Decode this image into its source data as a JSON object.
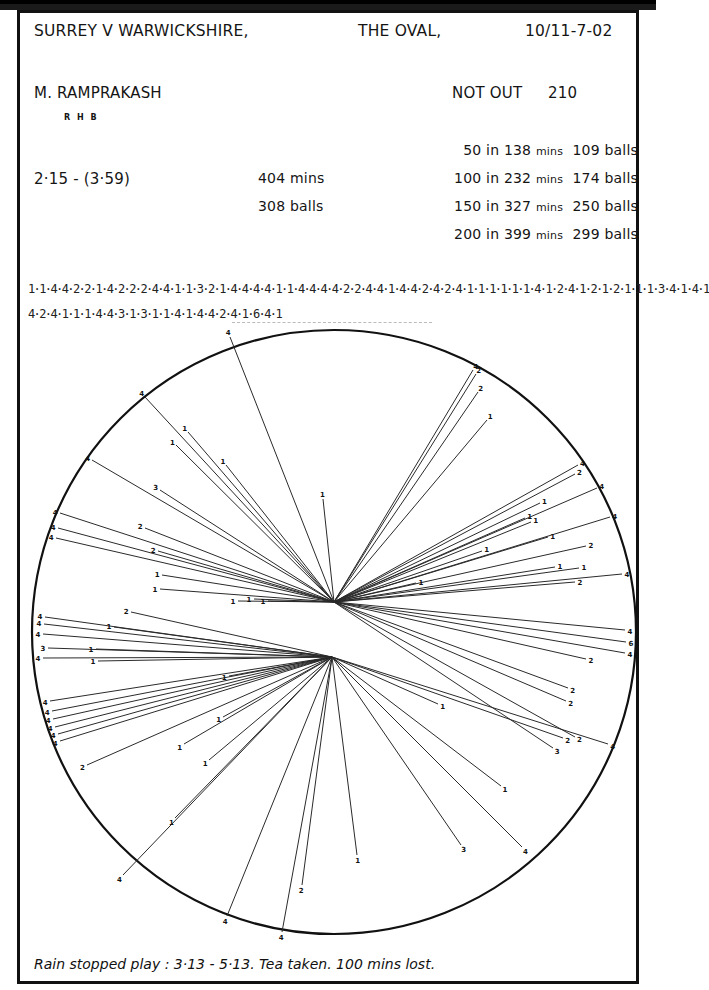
{
  "header": {
    "match": "SURREY V WARWICKSHIRE,",
    "venue": "THE OVAL,",
    "dates": "10/11-7-02"
  },
  "batsman": {
    "name": "M. RAMPRAKASH",
    "hand": "R H B",
    "status": "NOT OUT",
    "score": "210",
    "time_span": "2·15 - (3·59)",
    "minutes": "404 mins",
    "balls": "308 balls"
  },
  "milestones": [
    {
      "runs": "50 in",
      "mins": "138",
      "mins_unit": "mins",
      "balls": "109",
      "balls_unit": "balls"
    },
    {
      "runs": "100 in",
      "mins": "232",
      "mins_unit": "mins",
      "balls": "174",
      "balls_unit": "balls"
    },
    {
      "runs": "150 in",
      "mins": "327",
      "mins_unit": "mins",
      "balls": "250",
      "balls_unit": "balls"
    },
    {
      "runs": "200 in",
      "mins": "399",
      "mins_unit": "mins",
      "balls": "299",
      "balls_unit": "balls"
    }
  ],
  "scoring_sequence": {
    "line1": "1·1·4·4·2·2·1·4·2·2·2·4·4·1·1·3·2·1·4·4·4·4·1·1·4·4·4·4·2·2·4·4·1·4·4·2·4·2·4·1·1·1·1·1·1·4·1·2·4·1·2·1·2·1·1·1·3·4·1·4·1",
    "line2": "4·2·4·1·1·1·4·4·3·1·3·1·1·4·1·4·4·2·4·1·6·4·1"
  },
  "footer": {
    "note": "Rain stopped play : 3·13 - 5·13. Tea taken. 100 mins lost."
  },
  "colors": {
    "ink": "#111111",
    "line": "#2a2a2a",
    "paper": "#ffffff"
  },
  "chart_data": {
    "type": "wagon-wheel",
    "circle": {
      "cx": 334,
      "cy": 632,
      "r": 302
    },
    "origins": {
      "upper": [
        334,
        602
      ],
      "lower": [
        332,
        657
      ]
    },
    "shots": [
      {
        "o": "upper",
        "x": 230,
        "y": 337,
        "runs": "4"
      },
      {
        "o": "upper",
        "x": 145,
        "y": 397,
        "runs": "4"
      },
      {
        "o": "upper",
        "x": 188,
        "y": 432,
        "runs": "1"
      },
      {
        "o": "upper",
        "x": 176,
        "y": 445,
        "runs": "1"
      },
      {
        "o": "upper",
        "x": 226,
        "y": 465,
        "runs": "1"
      },
      {
        "o": "upper",
        "x": 160,
        "y": 490,
        "runs": "3"
      },
      {
        "o": "upper",
        "x": 92,
        "y": 460,
        "runs": "4"
      },
      {
        "o": "upper",
        "x": 60,
        "y": 513,
        "runs": "4"
      },
      {
        "o": "upper",
        "x": 145,
        "y": 528,
        "runs": "2"
      },
      {
        "o": "upper",
        "x": 58,
        "y": 528,
        "runs": "4"
      },
      {
        "o": "upper",
        "x": 56,
        "y": 538,
        "runs": "4"
      },
      {
        "o": "upper",
        "x": 158,
        "y": 551,
        "runs": "2"
      },
      {
        "o": "upper",
        "x": 162,
        "y": 575,
        "runs": "1"
      },
      {
        "o": "upper",
        "x": 160,
        "y": 589,
        "runs": "1"
      },
      {
        "o": "upper",
        "x": 323,
        "y": 499,
        "runs": "1"
      },
      {
        "o": "upper",
        "x": 238,
        "y": 601,
        "runs": "1"
      },
      {
        "o": "upper",
        "x": 254,
        "y": 599,
        "runs": "1"
      },
      {
        "o": "upper",
        "x": 268,
        "y": 601,
        "runs": "1"
      },
      {
        "o": "upper",
        "x": 473,
        "y": 370,
        "runs": "4"
      },
      {
        "o": "upper",
        "x": 476,
        "y": 374,
        "runs": "2"
      },
      {
        "o": "upper",
        "x": 478,
        "y": 392,
        "runs": "2"
      },
      {
        "o": "upper",
        "x": 487,
        "y": 420,
        "runs": "1"
      },
      {
        "o": "upper",
        "x": 578,
        "y": 465,
        "runs": "4"
      },
      {
        "o": "upper",
        "x": 575,
        "y": 474,
        "runs": "2"
      },
      {
        "o": "upper",
        "x": 597,
        "y": 488,
        "runs": "4"
      },
      {
        "o": "upper",
        "x": 540,
        "y": 503,
        "runs": "1"
      },
      {
        "o": "upper",
        "x": 525,
        "y": 518,
        "runs": "1"
      },
      {
        "o": "upper",
        "x": 531,
        "y": 522,
        "runs": "1"
      },
      {
        "o": "upper",
        "x": 548,
        "y": 537,
        "runs": "1"
      },
      {
        "o": "upper",
        "x": 482,
        "y": 551,
        "runs": "1"
      },
      {
        "o": "upper",
        "x": 610,
        "y": 517,
        "runs": "4"
      },
      {
        "o": "upper",
        "x": 586,
        "y": 546,
        "runs": "2"
      },
      {
        "o": "upper",
        "x": 555,
        "y": 567,
        "runs": "1"
      },
      {
        "o": "upper",
        "x": 579,
        "y": 568,
        "runs": "1"
      },
      {
        "o": "upper",
        "x": 622,
        "y": 574,
        "runs": "4"
      },
      {
        "o": "upper",
        "x": 575,
        "y": 582,
        "runs": "2"
      },
      {
        "o": "upper",
        "x": 416,
        "y": 583,
        "runs": "1"
      },
      {
        "o": "upper",
        "x": 625,
        "y": 630,
        "runs": "4"
      },
      {
        "o": "upper",
        "x": 626,
        "y": 642,
        "runs": "6"
      },
      {
        "o": "upper",
        "x": 625,
        "y": 653,
        "runs": "4"
      },
      {
        "o": "upper",
        "x": 586,
        "y": 659,
        "runs": "2"
      },
      {
        "o": "upper",
        "x": 568,
        "y": 688,
        "runs": "2"
      },
      {
        "o": "upper",
        "x": 566,
        "y": 701,
        "runs": "2"
      },
      {
        "o": "upper",
        "x": 575,
        "y": 737,
        "runs": "2"
      },
      {
        "o": "upper",
        "x": 553,
        "y": 748,
        "runs": "3"
      },
      {
        "o": "lower",
        "x": 131,
        "y": 612,
        "runs": "2"
      },
      {
        "o": "lower",
        "x": 45,
        "y": 617,
        "runs": "4"
      },
      {
        "o": "lower",
        "x": 44,
        "y": 624,
        "runs": "4"
      },
      {
        "o": "lower",
        "x": 114,
        "y": 627,
        "runs": "1"
      },
      {
        "o": "lower",
        "x": 43,
        "y": 634,
        "runs": "4"
      },
      {
        "o": "lower",
        "x": 48,
        "y": 648,
        "runs": "3"
      },
      {
        "o": "lower",
        "x": 96,
        "y": 649,
        "runs": "1"
      },
      {
        "o": "lower",
        "x": 43,
        "y": 658,
        "runs": "4"
      },
      {
        "o": "lower",
        "x": 98,
        "y": 661,
        "runs": "1"
      },
      {
        "o": "lower",
        "x": 50,
        "y": 701,
        "runs": "4"
      },
      {
        "o": "lower",
        "x": 52,
        "y": 711,
        "runs": "4"
      },
      {
        "o": "lower",
        "x": 53,
        "y": 719,
        "runs": "4"
      },
      {
        "o": "lower",
        "x": 55,
        "y": 727,
        "runs": "4"
      },
      {
        "o": "lower",
        "x": 58,
        "y": 734,
        "runs": "4"
      },
      {
        "o": "lower",
        "x": 60,
        "y": 741,
        "runs": "4"
      },
      {
        "o": "lower",
        "x": 87,
        "y": 765,
        "runs": "2"
      },
      {
        "o": "lower",
        "x": 229,
        "y": 676,
        "runs": "1"
      },
      {
        "o": "lower",
        "x": 223,
        "y": 717,
        "runs": "1"
      },
      {
        "o": "lower",
        "x": 184,
        "y": 744,
        "runs": "1"
      },
      {
        "o": "lower",
        "x": 209,
        "y": 760,
        "runs": "1"
      },
      {
        "o": "lower",
        "x": 175,
        "y": 818,
        "runs": "1"
      },
      {
        "o": "lower",
        "x": 123,
        "y": 875,
        "runs": "4"
      },
      {
        "o": "lower",
        "x": 227,
        "y": 916,
        "runs": "4"
      },
      {
        "o": "lower",
        "x": 282,
        "y": 932,
        "runs": "4"
      },
      {
        "o": "lower",
        "x": 302,
        "y": 885,
        "runs": "2"
      },
      {
        "o": "lower",
        "x": 357,
        "y": 855,
        "runs": "1"
      },
      {
        "o": "lower",
        "x": 461,
        "y": 845,
        "runs": "3"
      },
      {
        "o": "lower",
        "x": 522,
        "y": 847,
        "runs": "4"
      },
      {
        "o": "lower",
        "x": 501,
        "y": 786,
        "runs": "1"
      },
      {
        "o": "lower",
        "x": 438,
        "y": 704,
        "runs": "1"
      },
      {
        "o": "lower",
        "x": 608,
        "y": 744,
        "runs": "4"
      },
      {
        "o": "lower",
        "x": 563,
        "y": 738,
        "runs": "2"
      }
    ]
  }
}
